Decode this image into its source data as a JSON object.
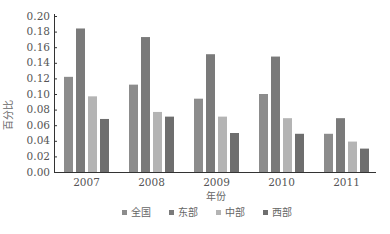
{
  "chart_data": {
    "type": "bar",
    "title": "",
    "xlabel": "年份",
    "ylabel": "百分比",
    "categories": [
      "2007",
      "2008",
      "2009",
      "2010",
      "2011"
    ],
    "series": [
      {
        "name": "全国",
        "color": "#8c8c8c",
        "values": [
          0.122,
          0.112,
          0.094,
          0.1,
          0.049
        ]
      },
      {
        "name": "东部",
        "color": "#7a7a7a",
        "values": [
          0.184,
          0.173,
          0.151,
          0.148,
          0.069
        ]
      },
      {
        "name": "中部",
        "color": "#b4b4b4",
        "values": [
          0.097,
          0.077,
          0.071,
          0.069,
          0.039
        ]
      },
      {
        "name": "西部",
        "color": "#6e6e6e",
        "values": [
          0.068,
          0.071,
          0.05,
          0.049,
          0.03
        ]
      }
    ],
    "yticks": [
      "0.00",
      "0.02",
      "0.04",
      "0.06",
      "0.08",
      "0.10",
      "0.12",
      "0.14",
      "0.16",
      "0.18",
      "0.20"
    ],
    "ylim": [
      0,
      0.2
    ],
    "grid": false,
    "legend_position": "bottom"
  }
}
